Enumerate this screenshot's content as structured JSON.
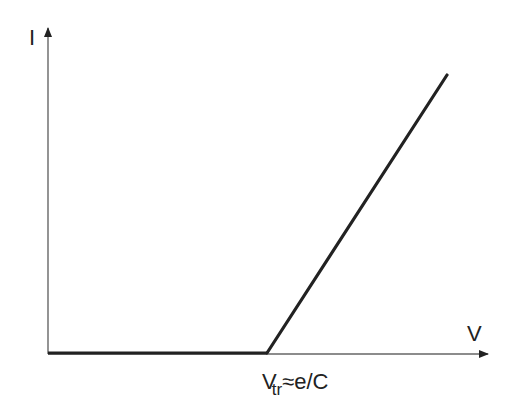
{
  "diagram": {
    "type": "line",
    "title": "",
    "y_axis": {
      "label": "I"
    },
    "x_axis": {
      "label": "V"
    },
    "threshold_label": {
      "main": "V",
      "subscript": "tr",
      "rest": "≈e/C"
    },
    "curve": {
      "description": "I = 0 for V below threshold V_tr, then increases linearly",
      "points": [
        {
          "v": 0,
          "i": 0
        },
        {
          "v": "V_tr",
          "i": 0
        },
        {
          "v": "V_max",
          "i": "I_max"
        }
      ]
    },
    "colors": {
      "axis": "#555555",
      "curve": "#222222",
      "text": "#222222"
    }
  }
}
